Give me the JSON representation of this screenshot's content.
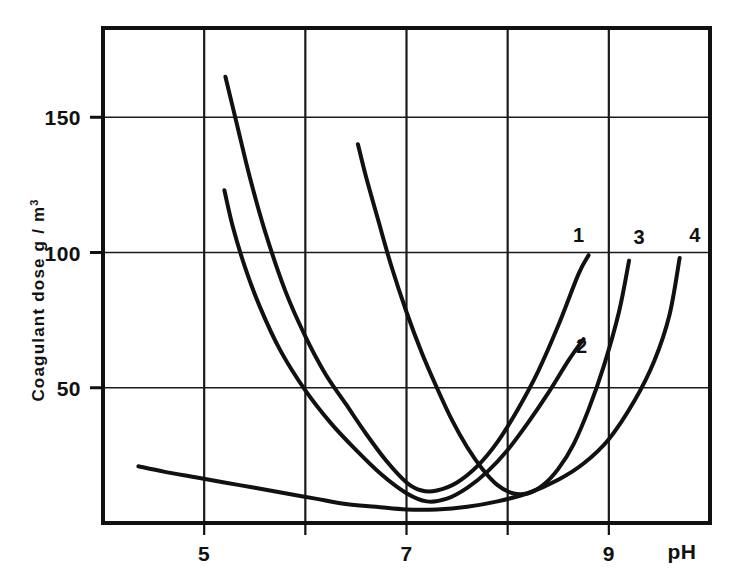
{
  "chart_data": {
    "type": "line",
    "title": "",
    "subtitle": "",
    "xlabel": "pH",
    "ylabel": "Coagulant  dose  g / m",
    "ylabel_superscript": "3",
    "xlim": [
      4,
      10
    ],
    "ylim": [
      0,
      183
    ],
    "grid": true,
    "legend_position": "inline-right-end-labels",
    "x_ticks": [
      4,
      5,
      6,
      7,
      8,
      9,
      10
    ],
    "x_tick_labels": [
      "",
      "5",
      "",
      "7",
      "",
      "9",
      ""
    ],
    "y_ticks": [
      50,
      100,
      150
    ],
    "y_tick_labels": [
      "50",
      "100",
      "150"
    ],
    "series": [
      {
        "name": "1",
        "label": "1",
        "label_x": 8.7,
        "label_y": 104,
        "points": [
          [
            5.21,
            165
          ],
          [
            5.32,
            148
          ],
          [
            5.45,
            128
          ],
          [
            5.6,
            108
          ],
          [
            5.8,
            86
          ],
          [
            6.0,
            69
          ],
          [
            6.2,
            55
          ],
          [
            6.4,
            44
          ],
          [
            6.6,
            33
          ],
          [
            6.8,
            23
          ],
          [
            7.0,
            15
          ],
          [
            7.15,
            12
          ],
          [
            7.3,
            12
          ],
          [
            7.5,
            15
          ],
          [
            7.7,
            21
          ],
          [
            7.9,
            30
          ],
          [
            8.1,
            42
          ],
          [
            8.3,
            56
          ],
          [
            8.5,
            73
          ],
          [
            8.7,
            92
          ],
          [
            8.8,
            99
          ]
        ]
      },
      {
        "name": "2",
        "label": "2",
        "label_x": 8.73,
        "label_y": 63,
        "points": [
          [
            5.2,
            123
          ],
          [
            5.28,
            110
          ],
          [
            5.4,
            95
          ],
          [
            5.55,
            80
          ],
          [
            5.75,
            64
          ],
          [
            6.0,
            49
          ],
          [
            6.25,
            37
          ],
          [
            6.5,
            27
          ],
          [
            6.75,
            18
          ],
          [
            7.0,
            11
          ],
          [
            7.2,
            8
          ],
          [
            7.4,
            9
          ],
          [
            7.6,
            13
          ],
          [
            7.8,
            19
          ],
          [
            8.0,
            27
          ],
          [
            8.2,
            37
          ],
          [
            8.4,
            48
          ],
          [
            8.6,
            60
          ],
          [
            8.75,
            68
          ]
        ]
      },
      {
        "name": "3",
        "label": "3",
        "label_x": 9.3,
        "label_y": 103,
        "points": [
          [
            6.52,
            140
          ],
          [
            6.6,
            128
          ],
          [
            6.72,
            112
          ],
          [
            6.85,
            95
          ],
          [
            7.0,
            78
          ],
          [
            7.15,
            63
          ],
          [
            7.3,
            50
          ],
          [
            7.45,
            38
          ],
          [
            7.6,
            28
          ],
          [
            7.75,
            20
          ],
          [
            7.9,
            14
          ],
          [
            8.05,
            11
          ],
          [
            8.2,
            11
          ],
          [
            8.35,
            14
          ],
          [
            8.5,
            20
          ],
          [
            8.65,
            29
          ],
          [
            8.8,
            42
          ],
          [
            8.95,
            58
          ],
          [
            9.1,
            78
          ],
          [
            9.2,
            97
          ]
        ]
      },
      {
        "name": "4",
        "label": "4",
        "label_x": 9.85,
        "label_y": 104,
        "points": [
          [
            4.35,
            21
          ],
          [
            4.6,
            19
          ],
          [
            4.9,
            17
          ],
          [
            5.2,
            15
          ],
          [
            5.5,
            13
          ],
          [
            5.8,
            11
          ],
          [
            6.1,
            9
          ],
          [
            6.4,
            7
          ],
          [
            6.7,
            6
          ],
          [
            7.0,
            5
          ],
          [
            7.3,
            5
          ],
          [
            7.6,
            6
          ],
          [
            7.9,
            8
          ],
          [
            8.2,
            11
          ],
          [
            8.5,
            16
          ],
          [
            8.75,
            22
          ],
          [
            9.0,
            31
          ],
          [
            9.25,
            45
          ],
          [
            9.45,
            60
          ],
          [
            9.6,
            77
          ],
          [
            9.7,
            98
          ]
        ]
      }
    ]
  },
  "axes": {
    "x_axis_title": "pH",
    "y_axis_title_main": "Coagulant  dose  g / m",
    "y_axis_title_exponent": "3"
  },
  "colors": {
    "ink": "#111111",
    "grid": "#1a1a1a",
    "background": "#ffffff"
  }
}
